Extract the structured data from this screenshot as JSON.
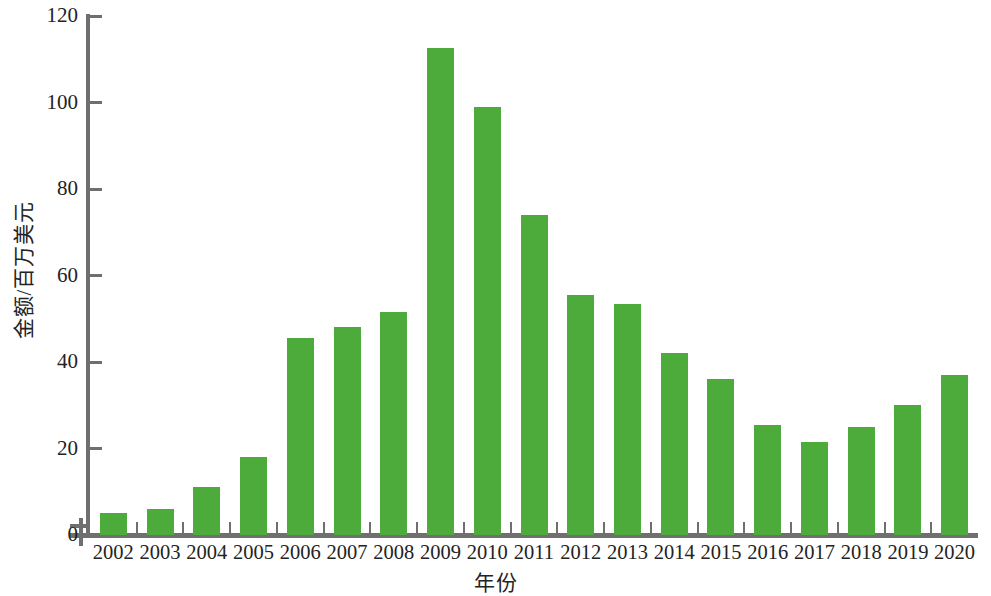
{
  "chart_data": {
    "type": "bar",
    "title": "",
    "subtitle": "",
    "xlabel": "年份",
    "ylabel": "金额/百万美元",
    "categories": [
      "2002",
      "2003",
      "2004",
      "2005",
      "2006",
      "2007",
      "2008",
      "2009",
      "2010",
      "2011",
      "2012",
      "2013",
      "2014",
      "2015",
      "2016",
      "2017",
      "2018",
      "2019",
      "2020"
    ],
    "values": [
      5,
      6,
      11,
      18,
      45.5,
      48,
      51.5,
      112.5,
      99,
      74,
      55.5,
      53.5,
      42,
      36,
      25.5,
      21.5,
      25,
      30,
      37
    ],
    "series": [
      {
        "name": "金额",
        "values": [
          5,
          6,
          11,
          18,
          45.5,
          48,
          51.5,
          112.5,
          99,
          74,
          55.5,
          53.5,
          42,
          36,
          25.5,
          21.5,
          25,
          30,
          37
        ]
      }
    ],
    "ylim": [
      0,
      120
    ],
    "yticks": [
      0,
      20,
      40,
      60,
      80,
      100,
      120
    ],
    "ytick_labels": [
      "0",
      "20",
      "40",
      "60",
      "80",
      "100",
      "120"
    ],
    "grid": false,
    "legend": null,
    "legend_position": "none",
    "bar_color": "#4cab3b",
    "axis_color": "#6f6f6f",
    "text_color": "#232323",
    "background": "#ffffff",
    "annotations": []
  }
}
